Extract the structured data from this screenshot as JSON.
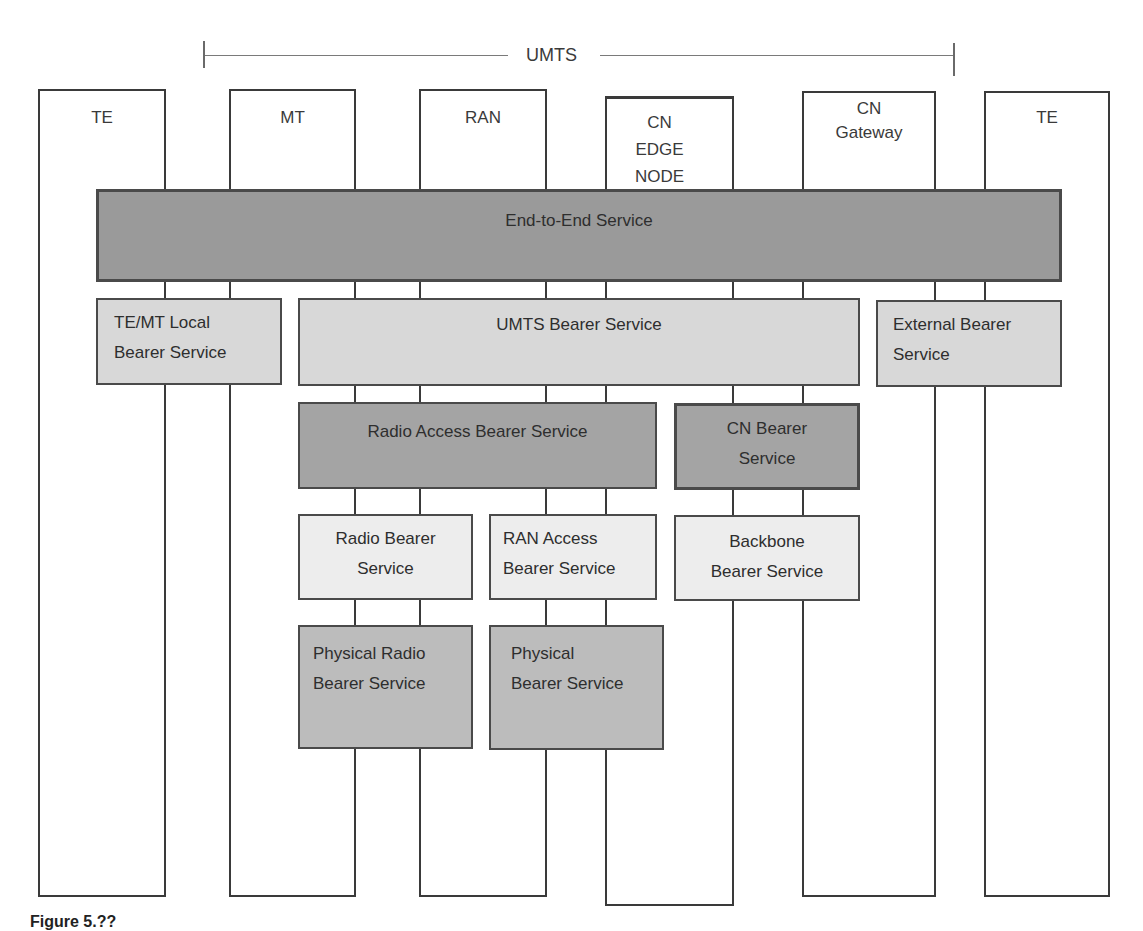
{
  "diagram": {
    "bracket": {
      "label": "UMTS",
      "x_start": 204,
      "x_end": 955,
      "y": 62
    },
    "columns": [
      {
        "id": "te-left",
        "label": "TE",
        "x": 38,
        "y": 89,
        "w": 128,
        "h": 808
      },
      {
        "id": "mt",
        "label": "MT",
        "x": 229,
        "y": 89,
        "w": 127,
        "h": 808
      },
      {
        "id": "ran",
        "label": "RAN",
        "x": 419,
        "y": 89,
        "w": 128,
        "h": 808
      },
      {
        "id": "cn-edge-node",
        "label": "CN\nEDGE\nNODE",
        "x": 605,
        "y": 96,
        "w": 129,
        "h": 810
      },
      {
        "id": "cn-gateway",
        "label": "CN\nGateway",
        "x": 802,
        "y": 91,
        "w": 134,
        "h": 806
      },
      {
        "id": "te-right",
        "label": "TE",
        "x": 984,
        "y": 91,
        "w": 126,
        "h": 806
      }
    ],
    "services": [
      {
        "id": "end-to-end-service",
        "label": "End-to-End Service",
        "x": 96,
        "y": 189,
        "w": 966,
        "h": 93,
        "tone": "dark",
        "align": "center",
        "valign": "top"
      },
      {
        "id": "te-mt-local-bearer-service",
        "label": "TE/MT Local\nBearer Service",
        "x": 96,
        "y": 298,
        "w": 186,
        "h": 87,
        "tone": "light",
        "align": "left",
        "valign": "top"
      },
      {
        "id": "umts-bearer-service",
        "label": "UMTS Bearer Service",
        "x": 298,
        "y": 298,
        "w": 562,
        "h": 88,
        "tone": "light",
        "align": "center",
        "valign": "top"
      },
      {
        "id": "external-bearer-service",
        "label": "External Bearer\nService",
        "x": 876,
        "y": 300,
        "w": 186,
        "h": 87,
        "tone": "light",
        "align": "left",
        "valign": "top"
      },
      {
        "id": "radio-access-bearer-service",
        "label": "Radio Access Bearer Service",
        "x": 298,
        "y": 402,
        "w": 359,
        "h": 87,
        "tone": "mid",
        "align": "center",
        "valign": "top"
      },
      {
        "id": "cn-bearer-service",
        "label": "CN Bearer\nService",
        "x": 674,
        "y": 403,
        "w": 186,
        "h": 87,
        "tone": "mid",
        "align": "center",
        "valign": "top"
      },
      {
        "id": "radio-bearer-service",
        "label": "Radio Bearer\nService",
        "x": 298,
        "y": 514,
        "w": 175,
        "h": 86,
        "tone": "pale",
        "align": "center",
        "valign": "top"
      },
      {
        "id": "ran-access-bearer-service",
        "label": "RAN Access\nBearer Service",
        "x": 489,
        "y": 514,
        "w": 168,
        "h": 86,
        "tone": "pale",
        "align": "left",
        "valign": "top"
      },
      {
        "id": "backbone-bearer-service",
        "label": "Backbone\nBearer Service",
        "x": 674,
        "y": 515,
        "w": 186,
        "h": 86,
        "tone": "pale",
        "align": "center",
        "valign": "top"
      },
      {
        "id": "physical-radio-bearer-service",
        "label": "Physical Radio\nBearer Service",
        "x": 298,
        "y": 625,
        "w": 175,
        "h": 124,
        "tone": "phys",
        "align": "left",
        "valign": "top"
      },
      {
        "id": "physical-bearer-service",
        "label": "Physical\nBearer Service",
        "x": 489,
        "y": 625,
        "w": 175,
        "h": 125,
        "tone": "phys",
        "align": "left",
        "valign": "top"
      }
    ],
    "caption": "Figure 5.??"
  }
}
